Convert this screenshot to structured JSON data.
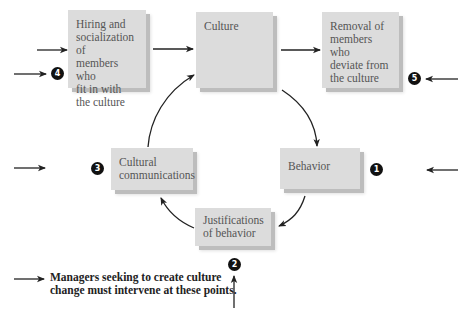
{
  "diagram": {
    "boxes": {
      "hiring": "Hiring and\nsocialization of\nmembers who\nfit in with\nthe culture",
      "culture": "Culture",
      "removal": "Removal of\nmembers who\ndeviate from\nthe culture",
      "behavior": "Behavior",
      "justifications": "Justifications\nof behavior",
      "communications": "Cultural\ncommunications"
    },
    "badges": {
      "b1": "1",
      "b2": "2",
      "b3": "3",
      "b4": "4",
      "b5": "5"
    },
    "note": "Managers seeking to create culture\nchange must intervene at these points.",
    "colors": {
      "box_fill": "#dcdcdc",
      "box_shadow": "#bdbdbd",
      "arrow": "#222222",
      "badge": "#111111"
    }
  }
}
